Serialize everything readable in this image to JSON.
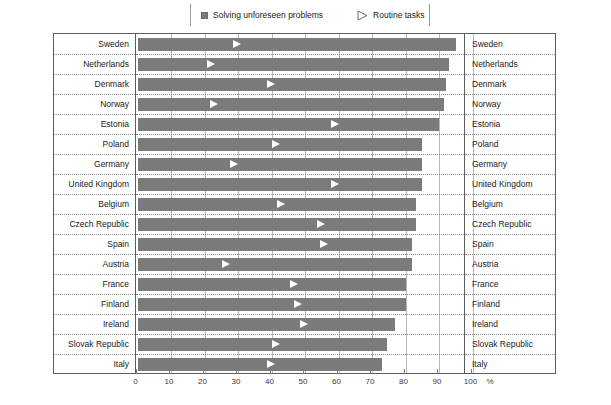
{
  "legend": {
    "items": [
      {
        "label": "Solving unforeseen problems",
        "marker": "gray-square-swatch"
      },
      {
        "label": "Routine tasks",
        "marker": "white-triangle-swatch"
      }
    ]
  },
  "axis": {
    "ticks": [
      "0",
      "10",
      "20",
      "30",
      "40",
      "50",
      "60",
      "70",
      "80",
      "90",
      "100"
    ],
    "unit": "%",
    "min": 0,
    "max": 100
  },
  "colors": {
    "bar": "#7b7b7b",
    "marker": "#ffffff",
    "frame": "#5d5d5d",
    "gridline": "#b9b9b9",
    "rowseparator": "#8e8e8e"
  },
  "chart_data": {
    "type": "bar",
    "title": "",
    "xlabel": "%",
    "ylabel": "",
    "xlim": [
      0,
      100
    ],
    "grid": true,
    "legend_position": "top",
    "orientation": "horizontal",
    "categories": [
      "Sweden",
      "Netherlands",
      "Denmark",
      "Norway",
      "Estonia",
      "Poland",
      "Germany",
      "United Kingdom",
      "Belgium",
      "Czech Republic",
      "Spain",
      "Austria",
      "France",
      "Finland",
      "Ireland",
      "Slovak Republic",
      "Italy"
    ],
    "series": [
      {
        "name": "Solving unforeseen problems",
        "type": "bar",
        "values": [
          95,
          93,
          92,
          91.5,
          90,
          85,
          85,
          85,
          83,
          83,
          82,
          82,
          80,
          80,
          77,
          74.5,
          73
        ]
      },
      {
        "name": "Routine tasks",
        "type": "marker",
        "values": [
          31,
          23,
          41,
          24,
          60,
          42.5,
          30,
          60,
          44,
          56,
          57,
          27.5,
          48,
          49,
          51,
          42.5,
          41
        ]
      }
    ]
  }
}
